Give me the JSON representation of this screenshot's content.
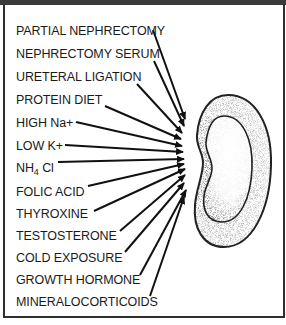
{
  "diagram": {
    "target": "kidney",
    "labels": [
      {
        "id": "partial-nephrectomy",
        "text": "PARTIAL NEPHRECTOMY",
        "y": 30
      },
      {
        "id": "nephrectomy-serum",
        "text": "NEPHRECTOMY SERUM",
        "y": 53
      },
      {
        "id": "ureteral-ligation",
        "text": "URETERAL LIGATION",
        "y": 76
      },
      {
        "id": "protein-diet",
        "text": "PROTEIN DIET",
        "y": 99
      },
      {
        "id": "high-na",
        "text": "HIGH Na+",
        "y": 122
      },
      {
        "id": "low-k",
        "text": "LOW K+",
        "y": 145
      },
      {
        "id": "nh4-cl",
        "text": "NH4 Cl",
        "y": 168
      },
      {
        "id": "folic-acid",
        "text": "FOLIC ACID",
        "y": 191
      },
      {
        "id": "thyroxine",
        "text": "THYROXINE",
        "y": 213
      },
      {
        "id": "testosterone",
        "text": "TESTOSTERONE",
        "y": 236
      },
      {
        "id": "cold-exposure",
        "text": "COLD EXPOSURE",
        "y": 258
      },
      {
        "id": "growth-hormone",
        "text": "GROWTH HORMONE",
        "y": 281
      },
      {
        "id": "mineralocorticoids",
        "text": "MINERALOCORTICOIDS",
        "y": 303
      }
    ],
    "nh4cl_parts": {
      "main": "NH",
      "sub": "4",
      "rest": " Cl"
    },
    "colors": {
      "ink": "#1a1a1a",
      "frame": "#2e2e2e",
      "stipple": "#555555"
    }
  }
}
